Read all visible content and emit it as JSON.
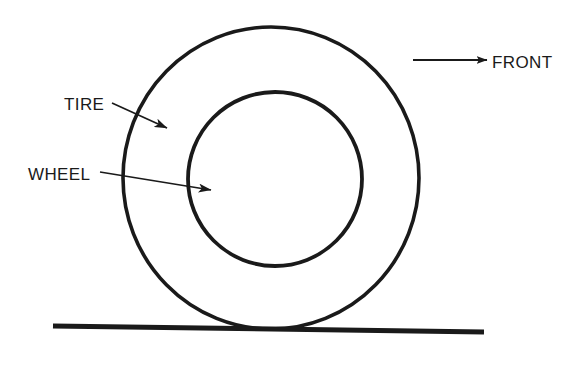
{
  "diagram": {
    "background_color": "#ffffff",
    "ink_color": "#1a1a1a",
    "labels": {
      "tire": "TIRE",
      "wheel": "WHEEL",
      "front": "FRONT"
    },
    "parts": [
      {
        "name": "tire",
        "label": "TIRE",
        "shape": "outer-circle",
        "center_x": 271,
        "center_y": 178,
        "radius_x": 148,
        "radius_y": 151
      },
      {
        "name": "wheel",
        "label": "WHEEL",
        "shape": "inner-circle",
        "center_x": 275,
        "center_y": 179,
        "radius_x": 87,
        "radius_y": 87
      }
    ],
    "ground": {
      "name": "ground-line",
      "x1": 53,
      "y1": 326,
      "x2": 484,
      "y2": 332,
      "thickness": 5
    },
    "direction_indicator": {
      "label": "FRONT",
      "arrow_x1": 413,
      "arrow_y1": 60,
      "arrow_x2": 487,
      "arrow_y2": 60,
      "label_x": 492,
      "label_y": 68
    },
    "leaders": [
      {
        "name": "tire-leader",
        "label": "TIRE",
        "text_x": 64,
        "text_y": 110,
        "line_x1": 112,
        "line_y1": 103,
        "line_x2": 167,
        "line_y2": 128
      },
      {
        "name": "wheel-leader",
        "label": "WHEEL",
        "text_x": 28,
        "text_y": 180,
        "line_x1": 100,
        "line_y1": 172,
        "line_x2": 211,
        "line_y2": 190
      }
    ]
  }
}
